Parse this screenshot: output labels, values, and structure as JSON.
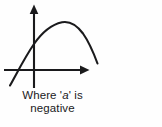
{
  "figure": {
    "name": "parabola-negative-a",
    "background_color": "#fefefe",
    "ink_color": "#1a1a1c",
    "caption": {
      "line1": "Where 'a' is",
      "line2": "negative",
      "full_text": "Where 'a' is negative",
      "variable": "a"
    },
    "axes": {
      "x_axis_label": "",
      "y_axis_label": "",
      "origin": {
        "x": 34,
        "y": 70
      },
      "x_axis_start": {
        "x": 4,
        "y": 70
      },
      "x_axis_end": {
        "x": 89,
        "y": 70
      },
      "y_axis_top": {
        "x": 34,
        "y": 5
      },
      "y_axis_bottom": {
        "x": 34,
        "y": 88
      },
      "x_arrowhead": "right-arrow-icon",
      "y_arrowhead": "up-arrow-icon",
      "stroke_width": 2
    }
  },
  "chart_data": {
    "type": "line",
    "title": "Where 'a' is negative",
    "xlabel": "",
    "ylabel": "",
    "grid": false,
    "legend": null,
    "curve_name": "downward-parabola",
    "leading_coefficient_sign": "negative",
    "annotations": [
      "Where 'a' is negative"
    ],
    "path_points": [
      {
        "x": 10,
        "y": 85
      },
      {
        "x": 20,
        "y": 68
      },
      {
        "x": 34,
        "y": 44
      },
      {
        "x": 48,
        "y": 31
      },
      {
        "x": 60,
        "y": 24
      },
      {
        "x": 70,
        "y": 22
      },
      {
        "x": 80,
        "y": 27
      },
      {
        "x": 88,
        "y": 39
      },
      {
        "x": 94,
        "y": 53
      },
      {
        "x": 97,
        "y": 63
      }
    ],
    "vertex": {
      "x": 70,
      "y": 22
    },
    "y_intercept": {
      "x": 34,
      "y": 43
    }
  }
}
